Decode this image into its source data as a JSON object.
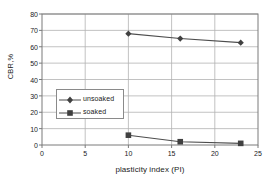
{
  "chart_data": {
    "type": "line",
    "title": "",
    "xlabel": "plasticity index (PI)",
    "ylabel": "CBR,%",
    "xlim": [
      0,
      25
    ],
    "ylim": [
      0,
      80
    ],
    "xticks": [
      0,
      5,
      10,
      15,
      20,
      25
    ],
    "yticks": [
      0,
      10,
      20,
      30,
      40,
      50,
      60,
      70,
      80
    ],
    "grid": "horizontal-and-vertical",
    "legend_position": "center-left-inside",
    "x": [
      10,
      16,
      23
    ],
    "series": [
      {
        "name": "unsoaked",
        "marker": "diamond",
        "color": "#4d4d4d",
        "values": [
          68,
          65,
          62.5
        ]
      },
      {
        "name": "soaked",
        "marker": "square",
        "color": "#4d4d4d",
        "values": [
          6,
          2,
          1
        ]
      }
    ]
  },
  "axes": {
    "y_title": "CBR,%",
    "x_title": "plasticity index (PI)",
    "y_tick_labels": [
      "0",
      "10",
      "20",
      "30",
      "40",
      "50",
      "60",
      "70",
      "80"
    ],
    "x_tick_labels": [
      "0",
      "5",
      "10",
      "15",
      "20",
      "25"
    ]
  },
  "legend": {
    "entries": [
      {
        "label": "unsoaked",
        "marker": "diamond"
      },
      {
        "label": "soaked",
        "marker": "square"
      }
    ]
  },
  "colors": {
    "line": "#4d4d4d",
    "marker": "#404040",
    "grid": "#b3b3b3",
    "frame": "#7a7a7a",
    "text": "#1a1a1a",
    "background": "#ffffff"
  }
}
